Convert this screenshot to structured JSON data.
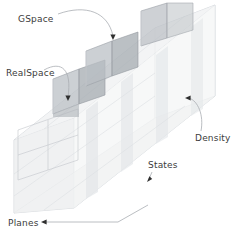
{
  "figure": {
    "background_color": "#ffffff",
    "label_color": "#3b3b3b",
    "wire_color": "#c9cdd2",
    "cube_fill_color": "#b9bec3",
    "slab_fill_color": "#e9ebed",
    "leader_color": "#a9adb2"
  },
  "labels": {
    "gspace": "GSpace",
    "realspace": "RealSpace",
    "density": "Density",
    "states": "States",
    "planes": "Planes"
  },
  "annotations": [
    {
      "name": "gspace",
      "text": "GSpace",
      "text_x": 18,
      "text_y": 22,
      "tip_x": 113,
      "tip_y": 38
    },
    {
      "name": "realspace",
      "text": "RealSpace",
      "text_x": 6,
      "text_y": 76,
      "tip_x": 68,
      "tip_y": 101
    },
    {
      "name": "density",
      "text": "Density",
      "text_x": 195,
      "text_y": 141,
      "tip_x": 186,
      "tip_y": 98
    },
    {
      "name": "states",
      "text": "States",
      "text_x": 148,
      "text_y": 168,
      "tip_x": 148,
      "tip_y": 181
    },
    {
      "name": "planes",
      "text": "Planes",
      "text_x": 8,
      "text_y": 226,
      "tip_x": 41,
      "tip_y": 222
    }
  ],
  "cubes": [
    {
      "index": 0,
      "step": 0,
      "shade": "mid"
    },
    {
      "index": 1,
      "step": 0,
      "shade": "dark"
    },
    {
      "index": 2,
      "step": 1,
      "shade": "mid"
    },
    {
      "index": 3,
      "step": 1,
      "shade": "dark"
    },
    {
      "index": 4,
      "step": 2,
      "shade": "mid"
    },
    {
      "index": 5,
      "step": 2,
      "shade": "dark"
    },
    {
      "index": 6,
      "step": 3,
      "shade": "mid"
    },
    {
      "index": 7,
      "step": 3,
      "shade": "mid"
    }
  ],
  "density_slabs": [
    {
      "index": 0,
      "opacity": 0.55
    },
    {
      "index": 1,
      "opacity": 0.5
    },
    {
      "index": 2,
      "opacity": 0.45
    },
    {
      "index": 3,
      "opacity": 0.4
    }
  ],
  "axes": {
    "states_direction": "depth",
    "planes_direction": "front-face-stack",
    "density_direction": "vertical-slabs"
  }
}
